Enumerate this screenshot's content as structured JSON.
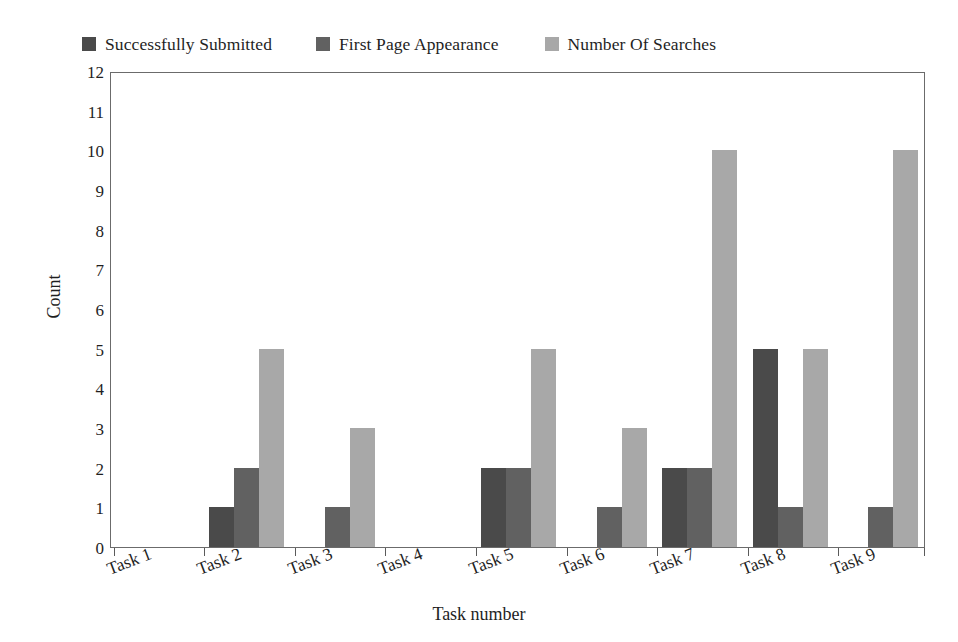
{
  "chart_data": {
    "type": "bar",
    "title": "",
    "xlabel": "Task number",
    "ylabel": "Count",
    "ylim": [
      0,
      12
    ],
    "ytick_labels": [
      "0",
      "1",
      "2",
      "3",
      "4",
      "5",
      "6",
      "7",
      "8",
      "9",
      "10",
      "11",
      "12"
    ],
    "grid": false,
    "legend_position": "top",
    "categories": [
      "Task 1",
      "Task 2",
      "Task 3",
      "Task 4",
      "Task 5",
      "Task 6",
      "Task 7",
      "Task 8",
      "Task 9"
    ],
    "series": [
      {
        "name": "Successfully Submitted",
        "color": "#4a4a4a",
        "values": [
          0,
          1,
          0,
          0,
          2,
          0,
          2,
          5,
          0
        ]
      },
      {
        "name": "First Page Appearance",
        "color": "#616161",
        "values": [
          0,
          2,
          1,
          0,
          2,
          1,
          2,
          1,
          1
        ]
      },
      {
        "name": "Number Of Searches",
        "color": "#a8a8a8",
        "values": [
          0,
          5,
          3,
          0,
          5,
          3,
          10,
          5,
          10
        ]
      }
    ]
  },
  "axes": {
    "frame_color": "#6b6b6b",
    "tick_color": "#5a5a5a",
    "background": "#ffffff"
  }
}
